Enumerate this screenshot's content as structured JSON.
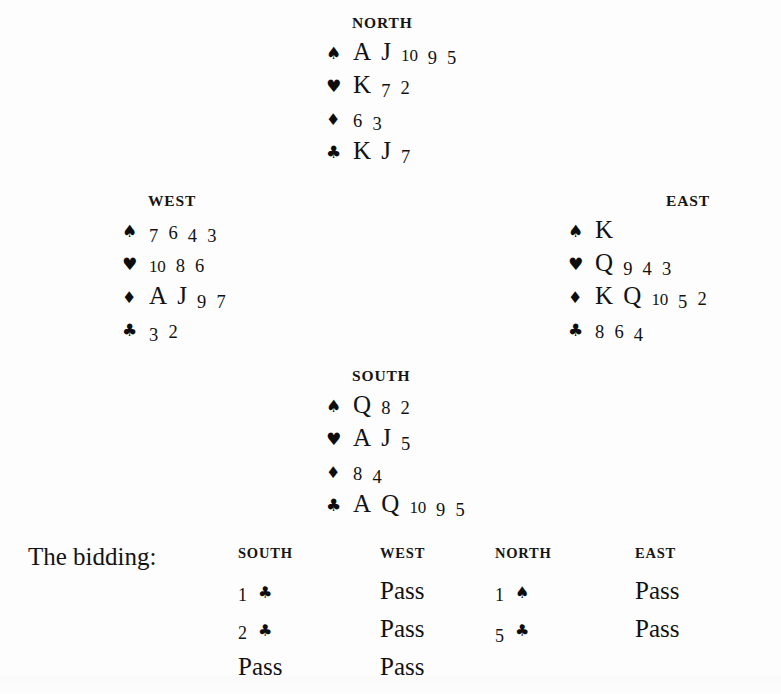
{
  "suits": {
    "spade": "♠",
    "heart": "♥",
    "diamond": "♦",
    "club": "♣"
  },
  "hands": {
    "north": {
      "label": "NORTH",
      "spades": "A J 10 9 5",
      "hearts": "K 7 2",
      "diamonds": "6 3",
      "clubs": "K J 7"
    },
    "west": {
      "label": "WEST",
      "spades": "7 6 4 3",
      "hearts": "10 8 6",
      "diamonds": "A J 9 7",
      "clubs": "3 2"
    },
    "east": {
      "label": "EAST",
      "spades": "K",
      "hearts": "Q 9 4 3",
      "diamonds": "K Q 10 5 2",
      "clubs": "8 6 4"
    },
    "south": {
      "label": "SOUTH",
      "spades": "Q 8 2",
      "hearts": "A J 5",
      "diamonds": "8 4",
      "clubs": "A Q 10 9 5"
    }
  },
  "bidding": {
    "title": "The bidding:",
    "columns": [
      "SOUTH",
      "WEST",
      "NORTH",
      "EAST"
    ],
    "rows": [
      [
        "1 ♣",
        "Pass",
        "1 ♠",
        "Pass"
      ],
      [
        "2 ♣",
        "Pass",
        "5 ♣",
        "Pass"
      ],
      [
        "Pass",
        "Pass",
        "",
        ""
      ]
    ]
  },
  "colors": {
    "page_background": "#fdfdfd",
    "ink": "#121212"
  }
}
